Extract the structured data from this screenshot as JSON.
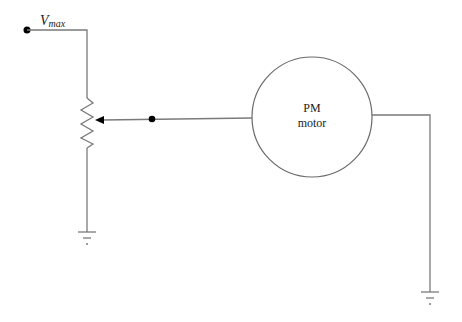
{
  "diagram": {
    "type": "circuit",
    "components": {
      "voltage_source": {
        "label_main": "V",
        "label_sub": "max",
        "terminal": "dot"
      },
      "potentiometer": {
        "type": "variable-resistor",
        "wiper": "arrow"
      },
      "motor": {
        "line1": "PM",
        "line2": "motor"
      },
      "grounds": [
        "ground-left",
        "ground-right"
      ],
      "junction_dot": "wiper-wire-dot"
    },
    "connections": [
      "V_max terminal -> potentiometer top",
      "potentiometer bottom -> ground (left)",
      "potentiometer wiper -> PM motor",
      "PM motor -> ground (right)"
    ]
  }
}
